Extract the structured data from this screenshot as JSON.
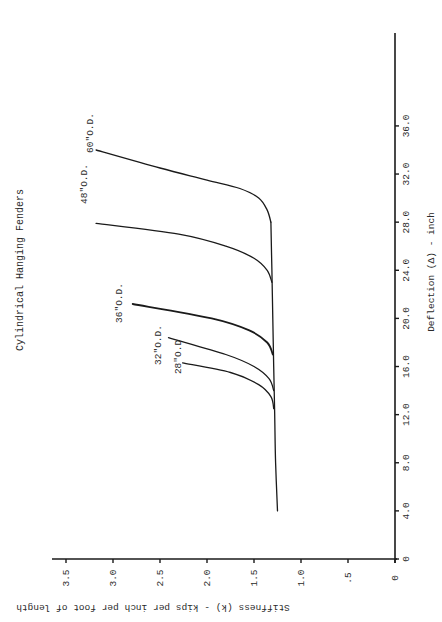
{
  "chart_data": {
    "type": "line",
    "title": "Cylindrical Hanging Fenders",
    "orientation_note": "page rotated 90 degrees; deflection axis vertical on right, stiffness axis horizontal along bottom",
    "xlabel": "Deflection (Δ) - inch",
    "ylabel": "Stiffness (k) - kips per inch per foot of length",
    "x_ticks": [
      "0",
      "4.0",
      "8.0",
      "12.0",
      "16.0",
      "20.0",
      "24.0",
      "28.0",
      "32.0",
      "36.0"
    ],
    "y_ticks": [
      "0",
      ".5",
      "1.0",
      "1.5",
      "2.0",
      "2.5",
      "3.0",
      "3.5"
    ],
    "xlim": [
      0,
      40
    ],
    "ylim": [
      0,
      3.6
    ],
    "grid": false,
    "legend": "inline labels at curve ends",
    "series": [
      {
        "name": "Common baseline",
        "points": [
          [
            4.0,
            1.25
          ],
          [
            8.0,
            1.27
          ],
          [
            12.0,
            1.28
          ],
          [
            16.0,
            1.29
          ],
          [
            20.0,
            1.3
          ],
          [
            24.0,
            1.31
          ],
          [
            28.0,
            1.32
          ]
        ]
      },
      {
        "name": "28\"O.D",
        "points": [
          [
            12.5,
            1.29
          ],
          [
            13.5,
            1.32
          ],
          [
            14.5,
            1.45
          ],
          [
            15.5,
            1.75
          ],
          [
            16.3,
            2.26
          ]
        ]
      },
      {
        "name": "32\"O.D.",
        "points": [
          [
            14.0,
            1.29
          ],
          [
            15.0,
            1.34
          ],
          [
            16.0,
            1.5
          ],
          [
            17.0,
            1.8
          ],
          [
            18.4,
            2.41
          ]
        ]
      },
      {
        "name": "36\"O.D.",
        "points": [
          [
            17.0,
            1.3
          ],
          [
            18.0,
            1.36
          ],
          [
            19.0,
            1.55
          ],
          [
            20.0,
            1.95
          ],
          [
            21.2,
            2.79
          ]
        ]
      },
      {
        "name": "48\"O.D.",
        "points": [
          [
            23.0,
            1.31
          ],
          [
            24.0,
            1.36
          ],
          [
            25.0,
            1.5
          ],
          [
            26.0,
            1.8
          ],
          [
            27.0,
            2.3
          ],
          [
            27.9,
            3.18
          ]
        ]
      },
      {
        "name": "60\"O.D.",
        "points": [
          [
            28.0,
            1.32
          ],
          [
            29.0,
            1.36
          ],
          [
            30.0,
            1.45
          ],
          [
            30.8,
            1.65
          ],
          [
            31.5,
            2.0
          ],
          [
            32.5,
            2.5
          ],
          [
            34.0,
            3.18
          ]
        ]
      }
    ]
  },
  "labels": {
    "title": "Cylindrical Hanging Fenders",
    "x_axis_title": "Deflection (Δ) - inch",
    "y_axis_title": "Stiffness (k) - kips per inch per foot of length",
    "series": {
      "s28": "28\"O.D",
      "s32": "32\"O.D.",
      "s36": "36\"O.D.",
      "s48": "48\"O.D.",
      "s60": "60\"O.D."
    },
    "deflection_ticks": [
      "0",
      "4.0",
      "8.0",
      "12.0",
      "16.0",
      "20.0",
      "24.0",
      "28.0",
      "32.0",
      "36.0"
    ],
    "stiffness_ticks": [
      "0",
      ".5",
      "1.0",
      "1.5",
      "2.0",
      "2.5",
      "3.0",
      "3.5"
    ]
  },
  "colors": {
    "ink": "#1a1a1a",
    "background": "#ffffff"
  }
}
